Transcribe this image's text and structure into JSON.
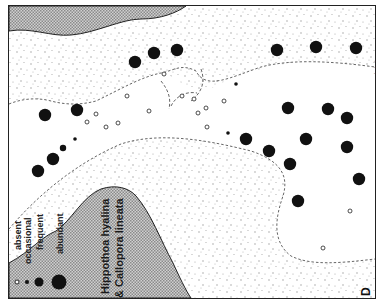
{
  "figure": {
    "panel_label": "D",
    "species_line1": "Hippothoa  hyalina",
    "species_line2": "& Callopora  lineata",
    "side_caption": "· · ·"
  },
  "legend": {
    "items": [
      {
        "label": "absent",
        "symbol": "open-circle",
        "size": 4
      },
      {
        "label": "occasional",
        "symbol": "small-dot",
        "size": 4
      },
      {
        "label": "frequent",
        "symbol": "dot",
        "size": 8
      },
      {
        "label": "abundant",
        "symbol": "large-dot",
        "size": 14
      }
    ]
  },
  "colors": {
    "land_hatch": "#b8b8b8",
    "ink": "#111111",
    "stipple": "#9a9a9a"
  },
  "stations": {
    "abundant": [
      [
        44,
        114
      ],
      [
        76,
        109
      ],
      [
        134,
        61
      ],
      [
        153,
        52
      ],
      [
        176,
        49
      ],
      [
        37,
        170
      ],
      [
        52,
        158
      ],
      [
        276,
        49
      ],
      [
        315,
        46
      ],
      [
        355,
        47
      ],
      [
        287,
        107
      ],
      [
        327,
        108
      ],
      [
        245,
        138
      ],
      [
        268,
        150
      ],
      [
        305,
        138
      ],
      [
        346,
        117
      ],
      [
        289,
        163
      ],
      [
        346,
        146
      ],
      [
        358,
        178
      ],
      [
        297,
        200
      ]
    ],
    "frequent": [
      [
        62,
        147
      ]
    ],
    "occasional": [
      [
        74,
        138
      ],
      [
        235,
        83
      ],
      [
        227,
        132
      ]
    ],
    "absent": [
      [
        126,
        95
      ],
      [
        105,
        126
      ],
      [
        117,
        122
      ],
      [
        163,
        73
      ],
      [
        181,
        95
      ],
      [
        193,
        98
      ],
      [
        223,
        100
      ],
      [
        205,
        107
      ],
      [
        206,
        126
      ],
      [
        197,
        112
      ],
      [
        148,
        110
      ],
      [
        349,
        210
      ],
      [
        322,
        247
      ],
      [
        86,
        121
      ],
      [
        95,
        113
      ]
    ]
  }
}
